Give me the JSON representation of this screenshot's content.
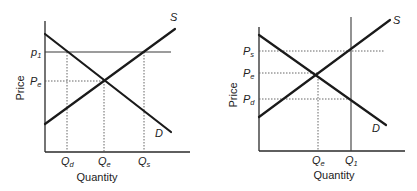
{
  "diagrams": [
    {
      "id": "price-floor",
      "y_axis_label": "Price",
      "x_axis_label": "Quantity",
      "curves": {
        "supply": "S",
        "demand": "D"
      },
      "price_labels": [
        {
          "main": "p",
          "sub": "1"
        },
        {
          "main": "P",
          "sub": "e"
        }
      ],
      "quantity_labels": [
        {
          "main": "Q",
          "sub": "d"
        },
        {
          "main": "Q",
          "sub": "e"
        },
        {
          "main": "Q",
          "sub": "s"
        }
      ]
    },
    {
      "id": "quantity-control",
      "y_axis_label": "Price",
      "x_axis_label": "Quantity",
      "curves": {
        "supply": "S",
        "demand": "D"
      },
      "price_labels": [
        {
          "main": "P",
          "sub": "s"
        },
        {
          "main": "P",
          "sub": "e"
        },
        {
          "main": "P",
          "sub": "d"
        }
      ],
      "quantity_labels": [
        {
          "main": "Q",
          "sub": "e"
        },
        {
          "main": "Q",
          "sub": "1"
        }
      ]
    }
  ]
}
